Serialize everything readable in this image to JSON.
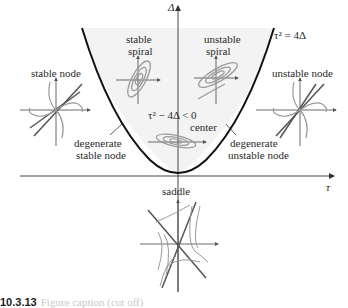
{
  "figure": {
    "type": "trace-determinant plane classification of fixed points",
    "axes": {
      "horizontal_label": "τ",
      "vertical_label": "Δ"
    },
    "curve_label": "τ² = 4Δ",
    "region_label": "τ² − 4Δ < 0",
    "regions": [
      {
        "name": "stable spiral",
        "line1": "stable",
        "line2": "spiral"
      },
      {
        "name": "unstable spiral",
        "line1": "unstable",
        "line2": "spiral"
      },
      {
        "name": "stable node",
        "line1": "stable node"
      },
      {
        "name": "unstable node",
        "line1": "unstable node"
      },
      {
        "name": "center",
        "line1": "center"
      },
      {
        "name": "degenerate stable node",
        "line1": "degenerate",
        "line2": "stable node"
      },
      {
        "name": "degenerate unstable node",
        "line1": "degenerate",
        "line2": "unstable node"
      },
      {
        "name": "saddle",
        "line1": "saddle"
      }
    ],
    "colors": {
      "curve": "#111111",
      "axis": "#333333",
      "trajectory": "#9a9a9a",
      "eigen_line": "#555555",
      "region_fill": "#f4f4f4"
    }
  },
  "caption": {
    "number": "10.3.13",
    "text": "Figure caption (cut off)"
  }
}
